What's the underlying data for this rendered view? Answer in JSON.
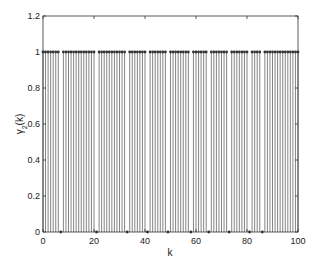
{
  "chart_data": {
    "type": "stem",
    "title": "",
    "xlabel": "k",
    "ylabel": "γ2(k)",
    "ylabel_main": "γ",
    "ylabel_sub": "2",
    "ylabel_rest": "(k)",
    "xlim": [
      0,
      100
    ],
    "ylim": [
      0,
      1.2
    ],
    "xticks": [
      0,
      20,
      40,
      60,
      80,
      100
    ],
    "xtick_labels": [
      "0",
      "20",
      "40",
      "60",
      "80",
      "100"
    ],
    "yticks": [
      0,
      0.2,
      0.4,
      0.6,
      0.8,
      1,
      1.2
    ],
    "ytick_labels": [
      "0",
      "0.2",
      "0.4",
      "0.6",
      "0.8",
      "1",
      "1.2"
    ],
    "grid": false,
    "legend": null,
    "x_range": [
      0,
      100
    ],
    "zero_at_k": [
      7,
      21,
      33,
      41,
      49,
      58,
      65,
      73,
      81,
      86
    ],
    "default_value": 1,
    "marker": "filled-dot",
    "color": "#333333"
  }
}
